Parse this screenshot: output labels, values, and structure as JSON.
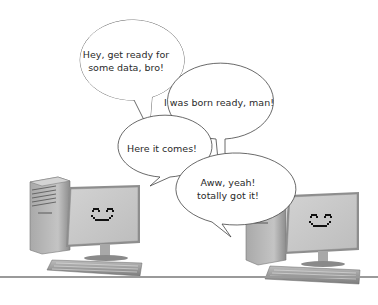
{
  "illustration": {
    "description": "Two smiling desktop computers exchanging speech bubbles about data transfer",
    "bubbles": [
      {
        "speaker": "left-computer",
        "lines": [
          "Hey, get ready for",
          "some data, bro!"
        ]
      },
      {
        "speaker": "right-computer",
        "lines": [
          "I was born ready, man!"
        ]
      },
      {
        "speaker": "left-computer",
        "lines": [
          "Here it comes!"
        ]
      },
      {
        "speaker": "right-computer",
        "lines": [
          "Aww, yeah!",
          "totally got it!"
        ]
      }
    ],
    "computers": [
      {
        "position": "left",
        "face": "smiley",
        "face_icon": "smiley-face-icon"
      },
      {
        "position": "right",
        "face": "smiley",
        "face_icon": "smiley-face-icon"
      }
    ],
    "colors": {
      "background": "#ffffff",
      "bubble_stroke": "#444444",
      "monitor_face": "#c9c9c9",
      "tower": "#b5b5b5",
      "divider": "#9a9a9a"
    }
  }
}
